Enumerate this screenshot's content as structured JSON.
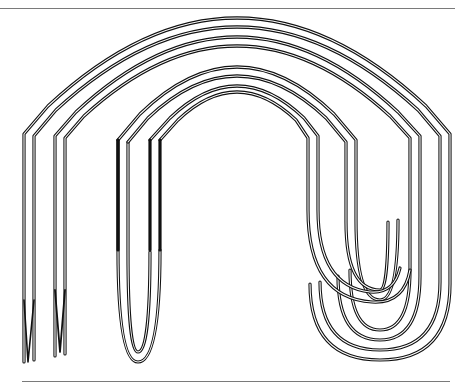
{
  "figure": {
    "colors": {
      "background": "#ffffff",
      "stroke": "#111111",
      "rule": "#7a7a7a"
    },
    "rules": [
      {
        "name": "top-rule",
        "x1": 0,
        "x2": 455,
        "y": 8
      },
      {
        "name": "bottom-rule",
        "x1": 22,
        "x2": 450,
        "y": 382
      }
    ],
    "tracks": [
      {
        "group": "outer",
        "offset": 0
      },
      {
        "group": "outer",
        "offset": 1
      },
      {
        "group": "outer",
        "offset": 2
      },
      {
        "group": "outer",
        "offset": 3
      },
      {
        "group": "inner",
        "offset": 0
      },
      {
        "group": "inner",
        "offset": 1
      },
      {
        "group": "inner",
        "offset": 2
      },
      {
        "group": "inner",
        "offset": 3
      }
    ]
  }
}
